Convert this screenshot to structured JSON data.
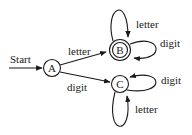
{
  "diagram": {
    "type": "finite-state-automaton",
    "start_label": "Start",
    "states": [
      {
        "id": "A",
        "label": "A",
        "accepting": false,
        "start": true
      },
      {
        "id": "B",
        "label": "B",
        "accepting": true,
        "start": false
      },
      {
        "id": "C",
        "label": "C",
        "accepting": false,
        "start": false
      }
    ],
    "transitions": [
      {
        "from": "A",
        "to": "B",
        "label": "letter"
      },
      {
        "from": "A",
        "to": "C",
        "label": "digit"
      },
      {
        "from": "B",
        "to": "B",
        "label": "letter"
      },
      {
        "from": "B",
        "to": "B",
        "label": "digit"
      },
      {
        "from": "C",
        "to": "C",
        "label": "digit"
      },
      {
        "from": "C",
        "to": "C",
        "label": "letter"
      }
    ],
    "colors": {
      "stroke": "#1a1a1a",
      "background": "#ffffff"
    }
  }
}
